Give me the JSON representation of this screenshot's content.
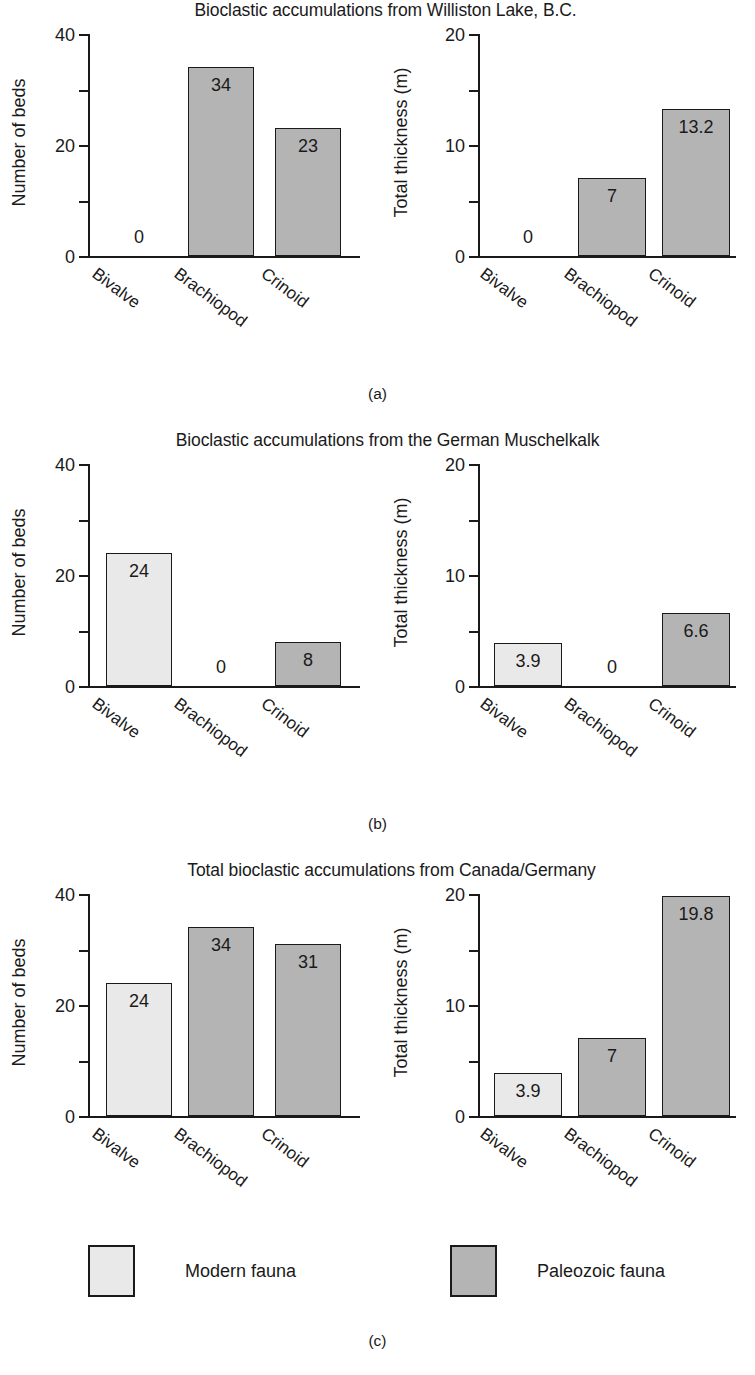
{
  "figure": {
    "categories": [
      "Bivalve",
      "Brachiopod",
      "Crinoid"
    ],
    "panels": [
      {
        "letter": "(a)",
        "title": "Bioclastic accumulations from Williston Lake, B.C.",
        "charts": [
          {
            "ylabel": "Number of beds",
            "ytick_labels": [
              "0",
              "20",
              "40"
            ],
            "values": [
              "0",
              "34",
              "23"
            ]
          },
          {
            "ylabel": "Total thickness (m)",
            "ytick_labels": [
              "0",
              "10",
              "20"
            ],
            "values": [
              "0",
              "7",
              "13.2"
            ]
          }
        ]
      },
      {
        "letter": "(b)",
        "title": "Bioclastic accumulations from the German Muschelkalk",
        "charts": [
          {
            "ylabel": "Number of beds",
            "ytick_labels": [
              "0",
              "20",
              "40"
            ],
            "values": [
              "24",
              "0",
              "8"
            ]
          },
          {
            "ylabel": "Total thickness (m)",
            "ytick_labels": [
              "0",
              "10",
              "20"
            ],
            "values": [
              "3.9",
              "0",
              "6.6"
            ]
          }
        ]
      },
      {
        "letter": "(c)",
        "title": "Total bioclastic accumulations from Canada/Germany",
        "charts": [
          {
            "ylabel": "Number of beds",
            "ytick_labels": [
              "0",
              "20",
              "40"
            ],
            "values": [
              "24",
              "34",
              "31"
            ]
          },
          {
            "ylabel": "Total thickness (m)",
            "ytick_labels": [
              "0",
              "10",
              "20"
            ],
            "values": [
              "3.9",
              "7",
              "19.8"
            ]
          }
        ]
      }
    ]
  },
  "legend": {
    "modern_label": "Modern fauna",
    "paleozoic_label": "Paleozoic fauna",
    "modern_color": "#e9e9e9",
    "paleozoic_color": "#b4b4b4"
  },
  "chart_data": [
    {
      "type": "bar",
      "panel": "(a)",
      "subplot": "left",
      "title": "Bioclastic accumulations from Williston Lake, B.C.",
      "xlabel": "",
      "ylabel": "Number of beds",
      "categories": [
        "Bivalve",
        "Brachiopod",
        "Crinoid"
      ],
      "values": [
        0,
        34,
        23
      ],
      "bar_fauna": [
        "modern",
        "paleozoic",
        "paleozoic"
      ],
      "ylim": [
        0,
        40
      ],
      "ytick_values": [
        0,
        10,
        20,
        30,
        40
      ],
      "ytick_labels": [
        "0",
        "",
        "20",
        "",
        "40"
      ],
      "grid": false,
      "legend_position": "figure-bottom"
    },
    {
      "type": "bar",
      "panel": "(a)",
      "subplot": "right",
      "title": "Bioclastic accumulations from Williston Lake, B.C.",
      "xlabel": "",
      "ylabel": "Total thickness (m)",
      "categories": [
        "Bivalve",
        "Brachiopod",
        "Crinoid"
      ],
      "values": [
        0,
        7,
        13.2
      ],
      "bar_fauna": [
        "modern",
        "paleozoic",
        "paleozoic"
      ],
      "ylim": [
        0,
        20
      ],
      "ytick_values": [
        0,
        5,
        10,
        15,
        20
      ],
      "ytick_labels": [
        "0",
        "",
        "10",
        "",
        "20"
      ],
      "grid": false,
      "legend_position": "figure-bottom"
    },
    {
      "type": "bar",
      "panel": "(b)",
      "subplot": "left",
      "title": "Bioclastic accumulations from the German Muschelkalk",
      "xlabel": "",
      "ylabel": "Number of beds",
      "categories": [
        "Bivalve",
        "Brachiopod",
        "Crinoid"
      ],
      "values": [
        24,
        0,
        8
      ],
      "bar_fauna": [
        "modern",
        "paleozoic",
        "paleozoic"
      ],
      "ylim": [
        0,
        40
      ],
      "ytick_values": [
        0,
        10,
        20,
        30,
        40
      ],
      "ytick_labels": [
        "0",
        "",
        "20",
        "",
        "40"
      ],
      "grid": false,
      "legend_position": "figure-bottom"
    },
    {
      "type": "bar",
      "panel": "(b)",
      "subplot": "right",
      "title": "Bioclastic accumulations from the German Muschelkalk",
      "xlabel": "",
      "ylabel": "Total thickness (m)",
      "categories": [
        "Bivalve",
        "Brachiopod",
        "Crinoid"
      ],
      "values": [
        3.9,
        0,
        6.6
      ],
      "bar_fauna": [
        "modern",
        "paleozoic",
        "paleozoic"
      ],
      "ylim": [
        0,
        20
      ],
      "ytick_values": [
        0,
        5,
        10,
        15,
        20
      ],
      "ytick_labels": [
        "0",
        "",
        "10",
        "",
        "20"
      ],
      "grid": false,
      "legend_position": "figure-bottom"
    },
    {
      "type": "bar",
      "panel": "(c)",
      "subplot": "left",
      "title": "Total bioclastic accumulations from Canada/Germany",
      "xlabel": "",
      "ylabel": "Number of beds",
      "categories": [
        "Bivalve",
        "Brachiopod",
        "Crinoid"
      ],
      "values": [
        24,
        34,
        31
      ],
      "bar_fauna": [
        "modern",
        "paleozoic",
        "paleozoic"
      ],
      "ylim": [
        0,
        40
      ],
      "ytick_values": [
        0,
        10,
        20,
        30,
        40
      ],
      "ytick_labels": [
        "0",
        "",
        "20",
        "",
        "40"
      ],
      "grid": false,
      "legend_position": "figure-bottom"
    },
    {
      "type": "bar",
      "panel": "(c)",
      "subplot": "right",
      "title": "Total bioclastic accumulations from Canada/Germany",
      "xlabel": "",
      "ylabel": "Total thickness (m)",
      "categories": [
        "Bivalve",
        "Brachiopod",
        "Crinoid"
      ],
      "values": [
        3.9,
        7,
        19.8
      ],
      "bar_fauna": [
        "modern",
        "paleozoic",
        "paleozoic"
      ],
      "ylim": [
        0,
        20
      ],
      "ytick_values": [
        0,
        5,
        10,
        15,
        20
      ],
      "ytick_labels": [
        "0",
        "",
        "10",
        "",
        "20"
      ],
      "grid": false,
      "legend_position": "figure-bottom"
    }
  ]
}
